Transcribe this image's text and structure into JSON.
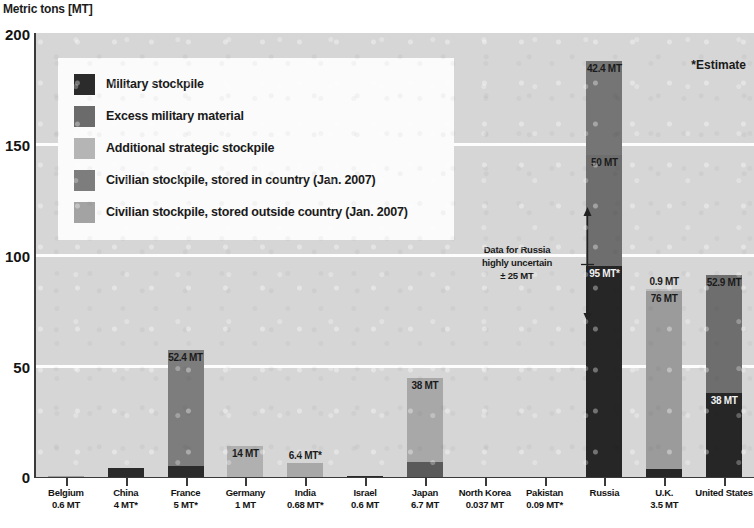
{
  "chart_data": {
    "type": "bar",
    "title": "Metric tons [MT]",
    "subtitle": "",
    "xlabel": "",
    "ylabel": "Metric tons [MT]",
    "ylim": [
      0,
      200
    ],
    "yticks": [
      0,
      50,
      100,
      150,
      200
    ],
    "grid": true,
    "stacked": true,
    "legend_position": "inside-top-left",
    "note_estimate": "*Estimate",
    "annotation": {
      "line1": "Data for Russia",
      "line2": "highly uncertain",
      "line3": "± 25 MT"
    },
    "series": [
      {
        "name": "Military stockpile",
        "color": "#262626"
      },
      {
        "name": "Excess military material",
        "color": "#6e6e6e"
      },
      {
        "name": "Additional strategic stockpile",
        "color": "#b4b4b4"
      },
      {
        "name": "Civilian stockpile, stored in country (Jan. 2007)",
        "color": "#7d7d7d"
      },
      {
        "name": "Civilian stockpile, stored outside country (Jan. 2007)",
        "color": "#9e9e9e"
      }
    ],
    "categories": [
      {
        "country": "Belgium",
        "value": "0.6 MT"
      },
      {
        "country": "China",
        "value": "4 MT*"
      },
      {
        "country": "France",
        "value": "5 MT*"
      },
      {
        "country": "Germany",
        "value": "1 MT"
      },
      {
        "country": "India",
        "value": "0.68 MT*"
      },
      {
        "country": "Israel",
        "value": "0.6 MT"
      },
      {
        "country": "Japan",
        "value": "6.7 MT"
      },
      {
        "country": "North Korea",
        "value": "0.037 MT"
      },
      {
        "country": "Pakistan",
        "value": "0.09 MT*"
      },
      {
        "country": "Russia",
        "value": ""
      },
      {
        "country": "U.K.",
        "value": "3.5 MT"
      },
      {
        "country": "United States",
        "value": ""
      }
    ],
    "bars": [
      {
        "country": "Belgium",
        "segments": [
          {
            "series": "Civilian stockpile, stored outside country (Jan. 2007)",
            "value": 0.6,
            "label": "",
            "color": "#9e9e9e"
          }
        ]
      },
      {
        "country": "China",
        "segments": [
          {
            "series": "Military stockpile",
            "value": 4,
            "label": "",
            "color": "#2b2b2b"
          }
        ]
      },
      {
        "country": "France",
        "segments": [
          {
            "series": "Military stockpile",
            "value": 5,
            "label": "",
            "color": "#2b2b2b"
          },
          {
            "series": "Civilian stockpile, stored in country (Jan. 2007)",
            "value": 52.4,
            "label": "52.4 MT",
            "color": "#7d7d7d"
          }
        ]
      },
      {
        "country": "Germany",
        "segments": [
          {
            "series": "Civilian stockpile, stored outside country (Jan. 2007)",
            "value": 14,
            "label": "14 MT",
            "color": "#b0b0b0"
          }
        ]
      },
      {
        "country": "India",
        "segments": [
          {
            "series": "Civilian stockpile, stored outside country (Jan. 2007)",
            "value": 6.4,
            "label": "6.4 MT*",
            "color": "#a8a8a8"
          }
        ]
      },
      {
        "country": "Israel",
        "segments": [
          {
            "series": "Military stockpile",
            "value": 0.6,
            "label": "",
            "color": "#2b2b2b"
          }
        ]
      },
      {
        "country": "Japan",
        "segments": [
          {
            "series": "Military stockpile",
            "value": 6.7,
            "label": "",
            "color": "#5a5a5a"
          },
          {
            "series": "Civilian stockpile, stored outside country (Jan. 2007)",
            "value": 38,
            "label": "38 MT",
            "color": "#a8a8a8"
          }
        ]
      },
      {
        "country": "North Korea",
        "segments": [
          {
            "series": "Military stockpile",
            "value": 0.037,
            "label": "",
            "color": "#2b2b2b"
          }
        ]
      },
      {
        "country": "Pakistan",
        "segments": [
          {
            "series": "Military stockpile",
            "value": 0.09,
            "label": "",
            "color": "#2b2b2b"
          }
        ]
      },
      {
        "country": "Russia",
        "segments": [
          {
            "series": "Military stockpile",
            "value": 95,
            "label": "95 MT*",
            "color": "#262626"
          },
          {
            "series": "Excess military material",
            "value": 50,
            "label": "50 MT",
            "color": "#6e6e6e"
          },
          {
            "series": "Additional strategic stockpile",
            "value": 42.4,
            "label": "42.4 MT",
            "color": "#757575"
          }
        ]
      },
      {
        "country": "U.K.",
        "segments": [
          {
            "series": "Military stockpile",
            "value": 3.5,
            "label": "",
            "color": "#262626"
          },
          {
            "series": "Excess military material",
            "value": 4.4,
            "label": "4.4 MT",
            "color": "#9b9b9b"
          },
          {
            "series": "Civilian stockpile, stored in country (Jan. 2007)",
            "value": 76,
            "label": "76 MT",
            "color": "#9b9b9b"
          },
          {
            "series": "Civilian stockpile, stored outside country (Jan. 2007)",
            "value": 0.9,
            "label": "0.9 MT",
            "color": "#bdbdbd"
          }
        ]
      },
      {
        "country": "United States",
        "segments": [
          {
            "series": "Military stockpile",
            "value": 38,
            "label": "38 MT",
            "color": "#262626"
          },
          {
            "series": "Excess military material",
            "value": 52.9,
            "label": "52.9 MT",
            "color": "#6e6e6e"
          }
        ]
      }
    ]
  },
  "axis": {
    "title": "Metric tons [MT]",
    "ytick_0": "0",
    "ytick_1": "50",
    "ytick_2": "100",
    "ytick_3": "150",
    "ytick_4": "200"
  },
  "legend": {
    "items": [
      {
        "label": "Military stockpile",
        "color": "#2b2b2b"
      },
      {
        "label": "Excess military material",
        "color": "#6b6b6b"
      },
      {
        "label": "Additional strategic stockpile",
        "color": "#b5b5b5"
      },
      {
        "label": "Civilian stockpile, stored in country (Jan. 2007)",
        "color": "#7d7d7d"
      },
      {
        "label": "Civilian stockpile, stored outside country (Jan. 2007)",
        "color": "#a3a3a3"
      }
    ]
  },
  "notes": {
    "estimate": "*Estimate",
    "russia_1": "Data for Russia",
    "russia_2": "highly uncertain",
    "russia_3": "± 25 MT"
  }
}
